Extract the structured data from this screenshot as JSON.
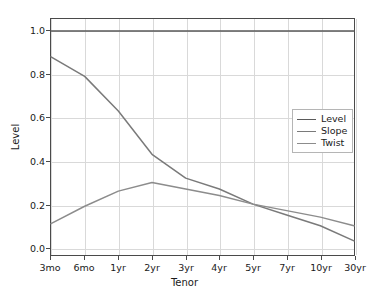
{
  "chart_data": {
    "type": "line",
    "title": "",
    "xlabel": "Tenor",
    "ylabel": "Level",
    "categories": [
      "3mo",
      "6mo",
      "1yr",
      "2yr",
      "3yr",
      "4yr",
      "5yr",
      "7yr",
      "10yr",
      "30yr"
    ],
    "xtick_labels": [
      "3mo",
      "6mo",
      "1yr",
      "2yr",
      "3yr",
      "4yr",
      "5yr",
      "7yr",
      "10yr",
      "30yr"
    ],
    "ytick_labels": [
      "0.0",
      "0.2",
      "0.4",
      "0.6",
      "0.8",
      "1.0"
    ],
    "yticks": [
      0.0,
      0.2,
      0.4,
      0.6,
      0.8,
      1.0
    ],
    "ylim": [
      -0.035,
      1.055
    ],
    "xlim": [
      0,
      9
    ],
    "grid": true,
    "grid_color": "#d9d9d9",
    "legend_position": "center right",
    "background": "#ffffff",
    "series": [
      {
        "name": "Level",
        "color": "#5a5a5a",
        "values": [
          1.0,
          1.0,
          1.0,
          1.0,
          1.0,
          1.0,
          1.0,
          1.0,
          1.0,
          1.0
        ]
      },
      {
        "name": "Slope",
        "color": "#7a7a7a",
        "values": [
          0.88,
          0.79,
          0.63,
          0.43,
          0.32,
          0.27,
          0.2,
          0.15,
          0.1,
          0.03
        ]
      },
      {
        "name": "Twist",
        "color": "#8c8c8c",
        "values": [
          0.11,
          0.19,
          0.26,
          0.3,
          0.27,
          0.24,
          0.2,
          0.17,
          0.14,
          0.1
        ]
      }
    ]
  },
  "legend": {
    "items": [
      {
        "label": "Level"
      },
      {
        "label": "Slope"
      },
      {
        "label": "Twist"
      }
    ]
  }
}
